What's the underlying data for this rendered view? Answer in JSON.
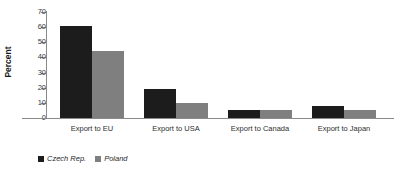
{
  "chart_data": {
    "type": "bar",
    "title": "",
    "xlabel": "",
    "ylabel": "Percent",
    "ylim": [
      0,
      70
    ],
    "yticks": [
      0,
      10,
      20,
      30,
      40,
      50,
      60,
      70
    ],
    "grid": false,
    "legend_position": "bottom-left",
    "categories": [
      "Export to EU",
      "Export to USA",
      "Export to Canada",
      "Export to Japan"
    ],
    "series": [
      {
        "name": "Czech Rep.",
        "color": "#1c1c1c",
        "values": [
          61,
          19,
          5,
          8
        ]
      },
      {
        "name": "Poland",
        "color": "#7f7f7f",
        "values": [
          44,
          10,
          5,
          5
        ]
      }
    ]
  },
  "axis": {
    "y_title": "Percent",
    "tick_labels": [
      "70",
      "60",
      "50",
      "40",
      "30",
      "20",
      "10",
      "0"
    ]
  },
  "legend": {
    "items": [
      {
        "label": "Czech Rep.",
        "color": "#1c1c1c"
      },
      {
        "label": "Poland",
        "color": "#7f7f7f"
      }
    ]
  }
}
